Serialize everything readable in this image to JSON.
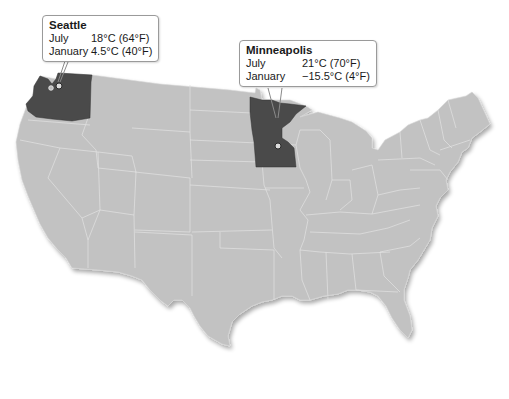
{
  "map": {
    "type": "choropleth-highlight",
    "region": "Contiguous United States",
    "base_color": "#c2c2c2",
    "border_color": "#e4e4e4",
    "highlight_color": "#4a4a4a",
    "highlighted_states": [
      "Washington",
      "Minnesota"
    ]
  },
  "callouts": [
    {
      "city": "Seattle",
      "state": "Washington",
      "rows": [
        {
          "month": "July",
          "temp": "18°C (64°F)"
        },
        {
          "month": "January",
          "temp": "4.5°C (40°F)"
        }
      ]
    },
    {
      "city": "Minneapolis",
      "state": "Minnesota",
      "rows": [
        {
          "month": "July",
          "temp": "21°C (70°F)"
        },
        {
          "month": "January",
          "temp": "−15.5°C (4°F)"
        }
      ]
    }
  ]
}
